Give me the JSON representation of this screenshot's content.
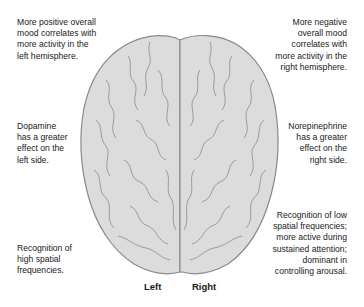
{
  "annotations": {
    "top_left": [
      "More positive overall",
      "mood correlates with",
      "more activity in the",
      "left hemisphere."
    ],
    "top_right": [
      "More negative",
      "overall mood",
      "correlates with",
      "more activity in the",
      "right hemisphere."
    ],
    "mid_left": [
      "Dopamine",
      "has a greater",
      "effect on the",
      "left side."
    ],
    "mid_right": [
      "Norepinephrine",
      "has a greater",
      "effect on the",
      "right side."
    ],
    "bottom_left": [
      "Recognition of",
      "high spatial",
      "frequencies."
    ],
    "bottom_right": [
      "Recognition of low",
      "spatial frequencies;",
      "more active during",
      "sustained attention;",
      "dominant in",
      "controlling arousal."
    ]
  },
  "hemisphere_labels": {
    "left": "Left",
    "right": "Right"
  },
  "colors": {
    "brain_fill": "#dcdcdc",
    "brain_stroke": "#8a8a8a",
    "text": "#1a1a1a"
  }
}
